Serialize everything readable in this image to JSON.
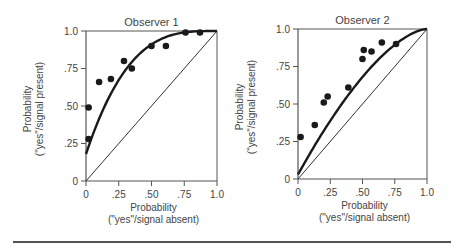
{
  "chart_data": [
    {
      "type": "scatter",
      "title": "Observer 1",
      "xlabel": "Probability\n(\"yes\"/signal absent)",
      "xlabel_lines": [
        "Probability",
        "(\"yes\"/signal absent)"
      ],
      "ylabel": "Probability\n(\"yes\"/signal present)",
      "ylabel_lines": [
        "Probability",
        "(\"yes\"/signal present)"
      ],
      "xlim": [
        0,
        1.0
      ],
      "ylim": [
        0,
        1.0
      ],
      "xticks": [
        "0",
        ".25",
        ".50",
        ".75",
        "1.0"
      ],
      "yticks": [
        "0",
        ".25",
        ".50",
        ".75",
        "1.0"
      ],
      "grid": false,
      "points": [
        {
          "x": 0.02,
          "y": 0.28
        },
        {
          "x": 0.02,
          "y": 0.49
        },
        {
          "x": 0.1,
          "y": 0.66
        },
        {
          "x": 0.19,
          "y": 0.68
        },
        {
          "x": 0.29,
          "y": 0.8
        },
        {
          "x": 0.35,
          "y": 0.75
        },
        {
          "x": 0.5,
          "y": 0.9
        },
        {
          "x": 0.61,
          "y": 0.9
        },
        {
          "x": 0.76,
          "y": 0.99
        },
        {
          "x": 0.87,
          "y": 0.99
        }
      ],
      "fitted_curve": "ROC curve (strongly bowed, d' high), starts near (0,0.18)",
      "reference_line": "diagonal chance line from (0,0) to (1,1)"
    },
    {
      "type": "scatter",
      "title": "Observer 2",
      "xlabel": "Probability\n(\"yes\"/signal absent)",
      "xlabel_lines": [
        "Probability",
        "(\"yes\"/signal absent)"
      ],
      "ylabel": "Probability\n(\"yes\"/signal present)",
      "ylabel_lines": [
        "Probability",
        "(\"yes\"/signal present)"
      ],
      "xlim": [
        0,
        1.0
      ],
      "ylim": [
        0,
        1.0
      ],
      "xticks": [
        "0",
        ".25",
        ".50",
        ".75",
        "1.0"
      ],
      "yticks": [
        "0",
        ".25",
        ".50",
        ".75",
        "1.0"
      ],
      "grid": false,
      "points": [
        {
          "x": 0.02,
          "y": 0.28
        },
        {
          "x": 0.13,
          "y": 0.36
        },
        {
          "x": 0.2,
          "y": 0.51
        },
        {
          "x": 0.23,
          "y": 0.55
        },
        {
          "x": 0.39,
          "y": 0.61
        },
        {
          "x": 0.5,
          "y": 0.8
        },
        {
          "x": 0.51,
          "y": 0.86
        },
        {
          "x": 0.57,
          "y": 0.85
        },
        {
          "x": 0.65,
          "y": 0.91
        },
        {
          "x": 0.76,
          "y": 0.9
        }
      ],
      "fitted_curve": "ROC curve (moderately bowed, lower d'), starts near (0,0.03)",
      "reference_line": "diagonal chance line from (0,0) to (1,1)"
    }
  ],
  "colors": {
    "ink": "#1a1a1a",
    "axis": "#555555",
    "text": "#444444",
    "background": "#ffffff"
  }
}
